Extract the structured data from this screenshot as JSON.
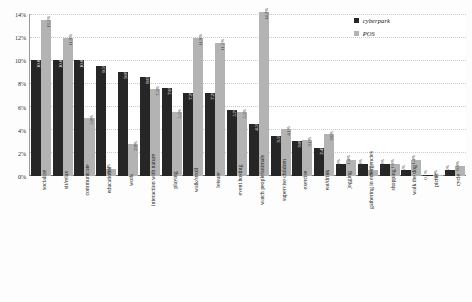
{
  "legend": {
    "position": "top-right",
    "entries": [
      {
        "label": "cyberpark",
        "color": "#262626",
        "swatch": "square-swatch-icon"
      },
      {
        "label": "POS",
        "color": "#b3b3b3",
        "swatch": "square-swatch-icon"
      }
    ]
  },
  "axis": {
    "y_ticks": [
      "0%",
      "2%",
      "4%",
      "6%",
      "8%",
      "10%",
      "12%",
      "14%"
    ]
  },
  "chart_data": {
    "type": "bar",
    "title": "",
    "xlabel": "",
    "ylabel": "",
    "ylim": [
      0,
      14
    ],
    "grid": true,
    "value_suffix": "%",
    "categories": [
      "socialize",
      "sit/relax",
      "communicate",
      "educational",
      "work",
      "interaction with nature",
      "playing",
      "walk/stroll",
      "leisure",
      "event hosting",
      "watch people/animals",
      "supervise children",
      "exercise",
      "eat/drink",
      "jogging",
      "gathering in emergencies",
      "shopping",
      "walk the dog",
      "picnic",
      "cycle"
    ],
    "series": [
      {
        "name": "cyberpark",
        "color": "#262626",
        "values": [
          10.0,
          10.0,
          10.0,
          9.5,
          9.0,
          8.6,
          7.6,
          7.2,
          7.2,
          5.7,
          4.5,
          3.5,
          3.0,
          2.4,
          1.0,
          1.0,
          1.0,
          0.5,
          0.1,
          0.5
        ],
        "labels": [
          "10.0%",
          "10.0%",
          "10.0%",
          "9.5%",
          "9.0%",
          "8.6%",
          "7.6%",
          "7.2%",
          "7.2%",
          "5.7%",
          "4.5%",
          "3.5%",
          "3.0%",
          "2.4%",
          "1.0%",
          "1.0%",
          "1.0%",
          "0.5%",
          "0.1%",
          "0.5%"
        ]
      },
      {
        "name": "POS",
        "color": "#b3b3b3",
        "values": [
          13.5,
          11.9,
          5.0,
          0.6,
          2.8,
          7.5,
          5.5,
          11.9,
          11.5,
          5.5,
          14.2,
          4.1,
          3.1,
          3.6,
          1.4,
          0.5,
          1.0,
          1.4,
          0.0,
          0.9
        ],
        "labels": [
          "13.5%",
          "11.9%",
          "5.0%",
          "0.6%",
          "2.8%",
          "7.5%",
          "5.5%",
          "11.9%",
          "11.5%",
          "5.5%",
          "14.2%",
          "4.1%",
          "3.1%",
          "3.6%",
          "1.4%",
          "0.5%",
          "1.0%",
          "1.4%",
          "0.0%",
          "0.9%"
        ]
      }
    ]
  }
}
